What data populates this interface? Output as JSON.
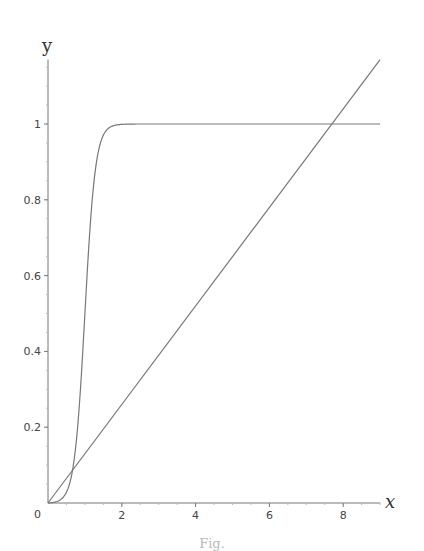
{
  "chart_data": {
    "type": "line",
    "title": "",
    "xlabel": "x",
    "ylabel": "y",
    "xlim": [
      0,
      9
    ],
    "ylim": [
      0,
      1.17
    ],
    "x_ticks": [
      0,
      2,
      4,
      6,
      8
    ],
    "x_tick_labels": [
      "0",
      "2",
      "4",
      "6",
      "8"
    ],
    "x_minor_step": 0.5,
    "y_ticks": [
      0.2,
      0.4,
      0.6,
      0.8,
      1
    ],
    "y_tick_labels": [
      "0.2",
      "0.4",
      "0.6",
      "0.8",
      "1"
    ],
    "y_minor_step": 0.05,
    "grid": false,
    "legend": null,
    "series": [
      {
        "name": "sigmoid",
        "description": "steep logistic curve rising from 0 near x=0.5 to plateau at y=1 by x≈2",
        "x": [
          0,
          0.25,
          0.5,
          0.6,
          0.7,
          0.8,
          0.9,
          1.0,
          1.1,
          1.2,
          1.3,
          1.4,
          1.5,
          1.75,
          2.0,
          2.5,
          3,
          4,
          5,
          6,
          7,
          8,
          9
        ],
        "y": [
          0.0,
          0.002,
          0.01,
          0.03,
          0.08,
          0.2,
          0.34,
          0.5,
          0.68,
          0.82,
          0.91,
          0.955,
          0.975,
          0.993,
          0.998,
          1.0,
          1.0,
          1.0,
          1.0,
          1.0,
          1.0,
          1.0,
          1.0
        ],
        "color": "#777777"
      },
      {
        "name": "line",
        "description": "straight line through origin, y ≈ 0.13x, crossing y=1 near x≈7.7",
        "x": [
          0,
          9
        ],
        "y": [
          0,
          1.17
        ],
        "color": "#777777"
      }
    ],
    "annotations": [
      "0 label at origin"
    ]
  },
  "labels": {
    "x_axis": "x",
    "y_axis": "y",
    "origin": "0",
    "caption": "Fig."
  }
}
